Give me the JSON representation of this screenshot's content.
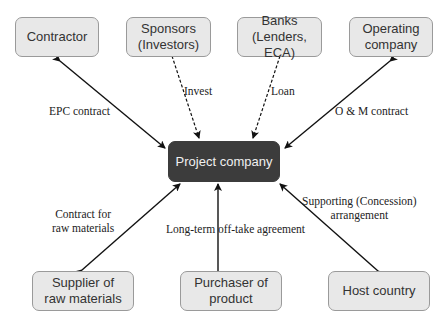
{
  "diagram": {
    "center": "Project company",
    "top_nodes": [
      {
        "id": "contractor",
        "line1": "Contractor",
        "line2": ""
      },
      {
        "id": "sponsors",
        "line1": "Sponsors",
        "line2": "(Investors)"
      },
      {
        "id": "banks",
        "line1": "Banks",
        "line2": "(Lenders, ECA)"
      },
      {
        "id": "operating",
        "line1": "Operating",
        "line2": "company"
      }
    ],
    "bottom_nodes": [
      {
        "id": "supplier",
        "line1": "Supplier of",
        "line2": "raw materials"
      },
      {
        "id": "purchaser",
        "line1": "Purchaser of",
        "line2": "product"
      },
      {
        "id": "host",
        "line1": "Host country",
        "line2": ""
      }
    ],
    "edge_labels": {
      "epc": "EPC contract",
      "invest": "Invest",
      "loan": "Loan",
      "om": "O & M contract",
      "raw_1": "Contract for",
      "raw_2": "raw materials",
      "offtake": "Long-term off-take agreement",
      "support_1": "Supporting (Concession)",
      "support_2": "arrangement"
    }
  }
}
